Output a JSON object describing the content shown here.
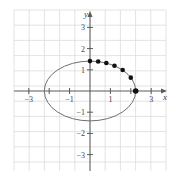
{
  "chart_data": {
    "type": "scatter",
    "title": "",
    "xlabel": "x",
    "ylabel": "y",
    "xlim": [
      -3.7,
      3.7
    ],
    "ylim": [
      -3.8,
      3.7
    ],
    "grid": true,
    "x_ticks": [
      -3,
      -2,
      -1,
      1,
      2,
      3
    ],
    "x_tick_labels": [
      "-3",
      "",
      "-1",
      "1",
      "",
      "3"
    ],
    "y_ticks": [
      -3,
      -2,
      -1,
      1,
      2,
      3
    ],
    "y_tick_labels": [
      "-3",
      "-2",
      "-1",
      "1",
      "2",
      "3"
    ],
    "curve": {
      "name": "ellipse",
      "equation": "x^2/5 + y^2/2 = 1",
      "semi_axis_x": 2.24,
      "semi_axis_y": 1.41
    },
    "points": {
      "x": [
        0,
        0.4,
        0.8,
        1.2,
        1.6,
        2.0,
        2.24
      ],
      "y": [
        1.41,
        1.39,
        1.32,
        1.19,
        0.99,
        0.63,
        0
      ]
    }
  },
  "colors": {
    "grid": "#dcdcdc",
    "axis": "#5a5a5a",
    "curve": "#707070",
    "points": "#111111"
  }
}
